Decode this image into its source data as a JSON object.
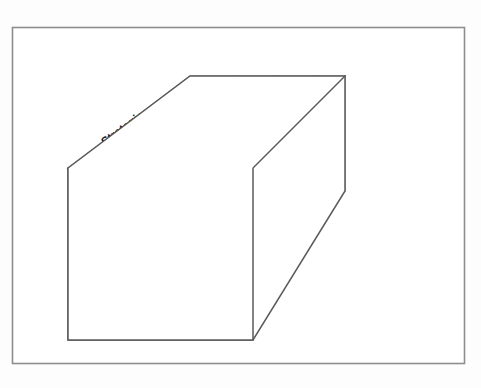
{
  "diagram": {
    "border_color": "#8e8e8e",
    "line_color": "#5a5a5a",
    "text_color": "#151515",
    "face_fill": "#ffffff",
    "background": "#fdfdfd"
  },
  "objectives_top": [
    {
      "label": "Strategic"
    },
    {
      "label": "Operations"
    },
    {
      "label": "Reporting"
    },
    {
      "label": "Compliance"
    }
  ],
  "components_front": [
    {
      "label": "Internal Environment"
    },
    {
      "label": "Objective Setting"
    },
    {
      "label": "Event Identification"
    },
    {
      "label": "Risk Assessment"
    },
    {
      "label": "Risk Response"
    },
    {
      "label": "Control Activities"
    },
    {
      "label": "Information / Communications"
    },
    {
      "label": "Monitoring"
    }
  ],
  "entities_side": [
    {
      "label": "Entry Level"
    },
    {
      "label": "Division"
    },
    {
      "label": "Business Unit"
    },
    {
      "label": "Subsidiary"
    }
  ]
}
